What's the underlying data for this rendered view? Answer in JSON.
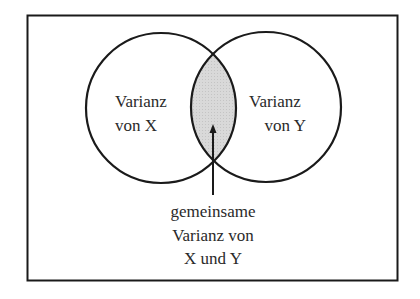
{
  "diagram": {
    "type": "venn",
    "sets": [
      {
        "id": "X",
        "label_lines": [
          "Varianz",
          "von X"
        ]
      },
      {
        "id": "Y",
        "label_lines": [
          "Varianz",
          "von Y"
        ]
      }
    ],
    "intersection": {
      "label_lines": [
        "gemeinsame",
        "Varianz von",
        "X und Y"
      ],
      "fill_color": "#d6d6d6"
    },
    "colors": {
      "stroke": "#1a1a1a",
      "background": "#ffffff",
      "text": "#2a2a2a"
    }
  }
}
